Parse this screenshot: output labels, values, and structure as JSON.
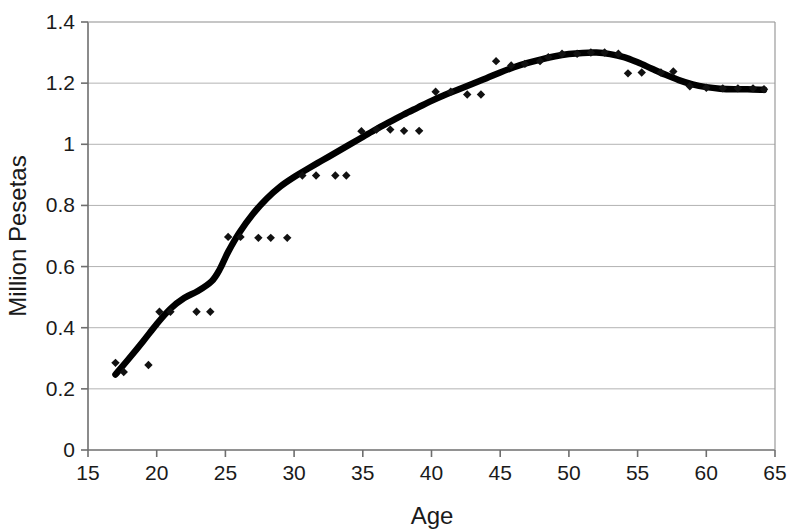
{
  "chart_data": {
    "type": "scatter",
    "title": "",
    "subtitle": "",
    "xlabel": "Age",
    "ylabel": "Million Pesetas",
    "xlim": [
      15,
      65
    ],
    "ylim": [
      0,
      1.4
    ],
    "xticks": [
      15,
      20,
      25,
      30,
      35,
      40,
      45,
      50,
      55,
      60,
      65
    ],
    "xtick_labels": [
      "15",
      "20",
      "25",
      "30",
      "35",
      "40",
      "45",
      "50",
      "55",
      "60",
      "65"
    ],
    "yticks": [
      0,
      0.2,
      0.4,
      0.6,
      0.8,
      1,
      1.2,
      1.4
    ],
    "ytick_labels": [
      "0",
      "0.2",
      "0.4",
      "0.6",
      "0.8",
      "1",
      "1.2",
      "1.4"
    ],
    "grid": "horizontal",
    "legend": "none",
    "marker": "diamond",
    "marker_color": "#111111",
    "line_color": "#000000",
    "grid_color": "#b3b3b3",
    "axis_color": "#808080",
    "background": "#ffffff",
    "series": [
      {
        "name": "Observed earnings",
        "type": "scatter",
        "points": [
          [
            17.0,
            0.285
          ],
          [
            17.6,
            0.255
          ],
          [
            19.4,
            0.278
          ],
          [
            20.2,
            0.452
          ],
          [
            21.0,
            0.452
          ],
          [
            22.9,
            0.452
          ],
          [
            23.9,
            0.452
          ],
          [
            25.2,
            0.697
          ],
          [
            26.1,
            0.697
          ],
          [
            27.4,
            0.694
          ],
          [
            28.3,
            0.694
          ],
          [
            29.5,
            0.694
          ],
          [
            30.6,
            0.898
          ],
          [
            31.6,
            0.898
          ],
          [
            33.0,
            0.898
          ],
          [
            33.8,
            0.898
          ],
          [
            34.9,
            1.043
          ],
          [
            36.0,
            1.048
          ],
          [
            37.0,
            1.048
          ],
          [
            38.0,
            1.044
          ],
          [
            39.1,
            1.044
          ],
          [
            40.3,
            1.172
          ],
          [
            41.4,
            1.172
          ],
          [
            42.6,
            1.163
          ],
          [
            43.6,
            1.163
          ],
          [
            44.7,
            1.272
          ],
          [
            45.8,
            1.258
          ],
          [
            46.8,
            1.263
          ],
          [
            47.9,
            1.272
          ],
          [
            48.5,
            1.285
          ],
          [
            49.5,
            1.296
          ],
          [
            50.6,
            1.296
          ],
          [
            51.6,
            1.3
          ],
          [
            52.6,
            1.3
          ],
          [
            53.6,
            1.296
          ],
          [
            54.3,
            1.232
          ],
          [
            55.3,
            1.235
          ],
          [
            56.7,
            1.235
          ],
          [
            57.6,
            1.238
          ],
          [
            58.8,
            1.19
          ],
          [
            60.0,
            1.185
          ],
          [
            61.2,
            1.183
          ],
          [
            62.3,
            1.183
          ],
          [
            63.4,
            1.183
          ],
          [
            64.2,
            1.18
          ]
        ]
      },
      {
        "name": "Smoothed fit",
        "type": "line",
        "points": [
          [
            17.0,
            0.247
          ],
          [
            18.0,
            0.3
          ],
          [
            19.0,
            0.355
          ],
          [
            20.0,
            0.412
          ],
          [
            21.0,
            0.462
          ],
          [
            22.0,
            0.497
          ],
          [
            23.0,
            0.52
          ],
          [
            24.0,
            0.552
          ],
          [
            24.6,
            0.592
          ],
          [
            25.2,
            0.648
          ],
          [
            26.0,
            0.71
          ],
          [
            27.0,
            0.772
          ],
          [
            28.0,
            0.822
          ],
          [
            29.0,
            0.862
          ],
          [
            30.0,
            0.893
          ],
          [
            31.0,
            0.92
          ],
          [
            32.0,
            0.946
          ],
          [
            33.0,
            0.972
          ],
          [
            34.0,
            0.998
          ],
          [
            35.0,
            1.024
          ],
          [
            36.0,
            1.05
          ],
          [
            37.0,
            1.074
          ],
          [
            38.0,
            1.098
          ],
          [
            39.0,
            1.12
          ],
          [
            40.0,
            1.142
          ],
          [
            41.0,
            1.162
          ],
          [
            42.0,
            1.18
          ],
          [
            43.0,
            1.198
          ],
          [
            44.0,
            1.216
          ],
          [
            45.0,
            1.235
          ],
          [
            46.0,
            1.252
          ],
          [
            47.0,
            1.266
          ],
          [
            48.0,
            1.278
          ],
          [
            49.0,
            1.288
          ],
          [
            50.0,
            1.295
          ],
          [
            51.0,
            1.299
          ],
          [
            52.0,
            1.3
          ],
          [
            53.0,
            1.295
          ],
          [
            54.0,
            1.285
          ],
          [
            55.0,
            1.268
          ],
          [
            56.0,
            1.248
          ],
          [
            57.0,
            1.228
          ],
          [
            58.0,
            1.21
          ],
          [
            59.0,
            1.196
          ],
          [
            60.0,
            1.187
          ],
          [
            61.0,
            1.182
          ],
          [
            62.0,
            1.18
          ],
          [
            63.0,
            1.18
          ],
          [
            64.2,
            1.178
          ]
        ]
      }
    ]
  }
}
